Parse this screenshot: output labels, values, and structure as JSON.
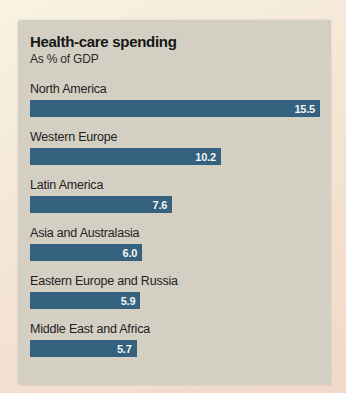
{
  "chart_data": {
    "type": "bar",
    "orientation": "horizontal",
    "title": "Health-care spending",
    "subtitle": "As % of GDP",
    "categories": [
      "North America",
      "Western Europe",
      "Latin America",
      "Asia and Australasia",
      "Eastern Europe and Russia",
      "Middle East and Africa"
    ],
    "values": [
      15.5,
      10.2,
      7.6,
      6.0,
      5.9,
      5.7
    ],
    "value_labels": [
      "15.5",
      "10.2",
      "7.6",
      "6.0",
      "5.9",
      "5.7"
    ],
    "xlim": [
      0,
      15.5
    ],
    "grid": false,
    "legend": "none",
    "value_label_position": "inside-right"
  },
  "colors": {
    "bar": "#34617e",
    "card_background": "#d3d0c3",
    "page_background_top": "#f8f3e2",
    "page_background_bottom": "#f2d8c9",
    "title_text": "#161616",
    "category_text": "#222222",
    "value_text": "#f5f5f2"
  }
}
